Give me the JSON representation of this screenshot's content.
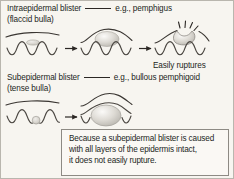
{
  "figure": {
    "background_color": "#f7f5f0",
    "border_color": "#b9b6ae",
    "ink_color": "#231f1c"
  },
  "sections": [
    {
      "id": "intraepidermal",
      "heading_main": "Intraepidermal blister",
      "heading_example": "e.g., pemphigus",
      "heading_sub": "(flaccid bulla)",
      "caption": "Easily ruptures",
      "stages": [
        {
          "name": "stage-early-flaccid-blister",
          "label": ""
        },
        {
          "name": "stage-enlarged-flaccid-bulla",
          "label": ""
        },
        {
          "name": "stage-ruptured-bulla",
          "label": ""
        }
      ],
      "connectors": [
        "arrow-right",
        "arrow-right"
      ]
    },
    {
      "id": "subepidermal",
      "heading_main": "Subepidermal blister",
      "heading_example": "e.g., bullous pemphigoid",
      "heading_sub": "(tense bulla)",
      "stages": [
        {
          "name": "stage-early-subepidermal-blister",
          "label": ""
        },
        {
          "name": "stage-tense-bulla",
          "label": ""
        }
      ],
      "connectors": [
        "arrow-right"
      ]
    }
  ],
  "note_box": {
    "lines": [
      "Because a subepidermal blister is caused",
      "with all layers of the epidermis intact,",
      "it does not easily rupture."
    ]
  }
}
